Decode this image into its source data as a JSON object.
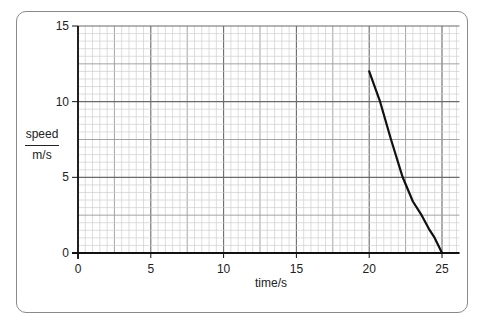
{
  "chart_data": {
    "type": "line",
    "title": "",
    "xlabel": "time/s",
    "ylabel_top": "speed",
    "ylabel_bottom": "m/s",
    "xlim": [
      0,
      26
    ],
    "ylim": [
      0,
      15
    ],
    "x_ticks": [
      "0",
      "5",
      "10",
      "15",
      "20",
      "25"
    ],
    "y_ticks": [
      "0",
      "5",
      "10",
      "15"
    ],
    "grid": {
      "major": 5,
      "medium": 2.5,
      "minor": 0.5
    },
    "series": [
      {
        "name": "speed",
        "x": [
          20,
          20.75,
          21.5,
          22.3,
          23.0,
          23.6,
          24.1,
          24.5,
          24.8,
          25
        ],
        "y": [
          12,
          10,
          7.5,
          5,
          3.4,
          2.5,
          1.6,
          1.0,
          0.4,
          0
        ]
      }
    ]
  }
}
